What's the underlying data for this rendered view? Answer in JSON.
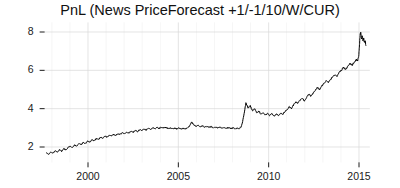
{
  "chart_data": {
    "type": "line",
    "title": "PnL (News PriceForecast +1/-1/10/W/CUR)",
    "xlabel": "",
    "ylabel": "",
    "xlim": [
      1997.6,
      2015.6
    ],
    "ylim": [
      1.2,
      8.5
    ],
    "xticks": [
      2000,
      2005,
      2010,
      2015
    ],
    "xtick_labels": [
      "2000",
      "2005",
      "2010",
      "2015"
    ],
    "yticks": [
      2,
      4,
      6,
      8
    ],
    "ytick_labels": [
      "2",
      "4",
      "6",
      "8"
    ],
    "grid": true,
    "grid_color": "#d8d8d8",
    "legend": null,
    "line_color": "#000000",
    "line_width": 1.0,
    "background": "#ffffff",
    "series": [
      {
        "name": "PnL",
        "x": [
          1997.7,
          1997.82,
          1997.94,
          1998.06,
          1998.18,
          1998.3,
          1998.42,
          1998.54,
          1998.66,
          1998.78,
          1998.9,
          1999.02,
          1999.14,
          1999.26,
          1999.38,
          1999.5,
          1999.62,
          1999.74,
          1999.86,
          1999.98,
          2000.1,
          2000.22,
          2000.34,
          2000.46,
          2000.58,
          2000.7,
          2000.82,
          2000.94,
          2001.06,
          2001.18,
          2001.3,
          2001.42,
          2001.54,
          2001.66,
          2001.78,
          2001.9,
          2002.02,
          2002.14,
          2002.26,
          2002.38,
          2002.5,
          2002.62,
          2002.74,
          2002.86,
          2002.98,
          2003.1,
          2003.22,
          2003.34,
          2003.46,
          2003.58,
          2003.7,
          2003.82,
          2003.94,
          2004.06,
          2004.18,
          2004.3,
          2004.42,
          2004.54,
          2004.66,
          2004.78,
          2004.9,
          2005.02,
          2005.14,
          2005.26,
          2005.38,
          2005.5,
          2005.62,
          2005.74,
          2005.86,
          2005.98,
          2006.1,
          2006.22,
          2006.34,
          2006.46,
          2006.58,
          2006.7,
          2006.82,
          2006.94,
          2007.06,
          2007.18,
          2007.3,
          2007.42,
          2007.54,
          2007.66,
          2007.78,
          2007.9,
          2008.02,
          2008.14,
          2008.26,
          2008.38,
          2008.5,
          2008.62,
          2008.74,
          2008.86,
          2008.98,
          2009.1,
          2009.22,
          2009.34,
          2009.46,
          2009.58,
          2009.7,
          2009.82,
          2009.94,
          2010.06,
          2010.18,
          2010.3,
          2010.42,
          2010.54,
          2010.66,
          2010.78,
          2010.9,
          2011.02,
          2011.14,
          2011.26,
          2011.38,
          2011.5,
          2011.62,
          2011.74,
          2011.86,
          2011.98,
          2012.1,
          2012.22,
          2012.34,
          2012.46,
          2012.58,
          2012.7,
          2012.82,
          2012.94,
          2013.06,
          2013.18,
          2013.3,
          2013.42,
          2013.54,
          2013.66,
          2013.78,
          2013.9,
          2014.02,
          2014.14,
          2014.26,
          2014.38,
          2014.5,
          2014.62,
          2014.74,
          2014.86,
          2014.92,
          2014.98,
          2015.02,
          2015.06,
          2015.1,
          2015.14,
          2015.18,
          2015.22,
          2015.26,
          2015.3,
          2015.34,
          2015.38
        ],
        "y": [
          1.7,
          1.62,
          1.74,
          1.66,
          1.8,
          1.72,
          1.86,
          1.78,
          1.92,
          1.84,
          1.98,
          2.05,
          1.96,
          2.1,
          2.04,
          2.18,
          2.12,
          2.24,
          2.18,
          2.3,
          2.26,
          2.38,
          2.32,
          2.44,
          2.4,
          2.5,
          2.46,
          2.56,
          2.52,
          2.62,
          2.58,
          2.66,
          2.61,
          2.7,
          2.66,
          2.74,
          2.7,
          2.78,
          2.73,
          2.82,
          2.77,
          2.86,
          2.81,
          2.9,
          2.85,
          2.94,
          2.89,
          2.97,
          2.92,
          3.0,
          2.95,
          3.02,
          2.97,
          3.04,
          2.99,
          3.02,
          2.97,
          3.0,
          2.96,
          2.99,
          2.95,
          2.98,
          2.94,
          2.97,
          2.94,
          3.0,
          3.1,
          3.3,
          3.16,
          3.08,
          3.12,
          3.05,
          3.1,
          3.04,
          3.08,
          3.02,
          3.06,
          3.0,
          3.04,
          2.99,
          3.03,
          2.98,
          3.02,
          2.97,
          3.01,
          2.96,
          3.0,
          2.96,
          2.99,
          2.95,
          3.1,
          3.6,
          4.3,
          4.05,
          4.15,
          3.9,
          4.0,
          3.78,
          3.88,
          3.7,
          3.8,
          3.66,
          3.76,
          3.64,
          3.74,
          3.62,
          3.72,
          3.64,
          3.78,
          3.7,
          3.85,
          3.95,
          4.1,
          4.0,
          4.2,
          4.35,
          4.28,
          4.45,
          4.55,
          4.4,
          4.6,
          4.75,
          4.66,
          4.82,
          4.95,
          5.1,
          5.0,
          5.18,
          5.32,
          5.45,
          5.36,
          5.52,
          5.65,
          5.78,
          5.7,
          5.88,
          6.0,
          6.15,
          6.05,
          6.22,
          6.35,
          6.28,
          6.42,
          6.55,
          6.5,
          6.7,
          7.2,
          7.85,
          8.0,
          7.6,
          7.8,
          7.5,
          7.7,
          7.45,
          7.55,
          7.3
        ]
      }
    ]
  }
}
